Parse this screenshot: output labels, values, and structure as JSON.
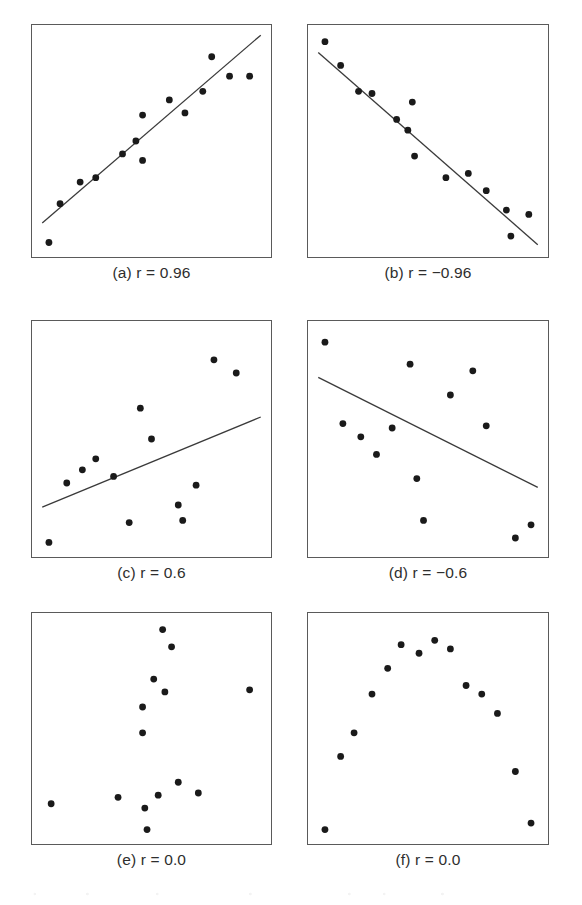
{
  "figure": {
    "background_color": "#ffffff",
    "frame_color": "#5a5a5a",
    "point_color": "#1a1a1a",
    "line_color": "#3a3a3a",
    "caption_color": "#2e2e2e",
    "point_radius": 3.4,
    "layout": {
      "rows": 3,
      "columns": 2
    }
  },
  "panels": [
    {
      "id": "a",
      "caption": "(a) r = 0.96",
      "box": {
        "x": 31,
        "y": 24,
        "width": 241,
        "height": 234
      },
      "caption_y": 264
    },
    {
      "id": "b",
      "caption": "(b) r = −0.96",
      "box": {
        "x": 307,
        "y": 24,
        "width": 242,
        "height": 234
      },
      "caption_y": 264
    },
    {
      "id": "c",
      "caption": "(c) r = 0.6",
      "box": {
        "x": 31,
        "y": 320,
        "width": 241,
        "height": 238
      },
      "caption_y": 564
    },
    {
      "id": "d",
      "caption": "(d) r = −0.6",
      "box": {
        "x": 307,
        "y": 320,
        "width": 242,
        "height": 238
      },
      "caption_y": 564
    },
    {
      "id": "e",
      "caption": "(e) r = 0.0",
      "box": {
        "x": 31,
        "y": 612,
        "width": 241,
        "height": 233
      },
      "caption_y": 851
    },
    {
      "id": "f",
      "caption": "(f) r = 0.0",
      "box": {
        "x": 307,
        "y": 612,
        "width": 242,
        "height": 233
      },
      "caption_y": 851
    }
  ],
  "chart_data": [
    {
      "type": "scatter",
      "id": "a",
      "title": "(a) r = 0.96",
      "correlation": 0.96,
      "xlabel": "",
      "ylabel": "",
      "xlim": [
        0,
        100
      ],
      "ylim": [
        0,
        100
      ],
      "grid": false,
      "legend": null,
      "fit_line": {
        "x1": 1,
        "y1": 12,
        "x2": 99,
        "y2": 99
      },
      "points": [
        [
          4,
          3
        ],
        [
          9,
          21
        ],
        [
          18,
          31
        ],
        [
          25,
          33
        ],
        [
          37,
          44
        ],
        [
          43,
          50
        ],
        [
          46,
          41
        ],
        [
          46,
          62
        ],
        [
          58,
          69
        ],
        [
          65,
          63
        ],
        [
          73,
          73
        ],
        [
          77,
          89
        ],
        [
          85,
          80
        ],
        [
          94,
          80
        ]
      ]
    },
    {
      "type": "scatter",
      "id": "b",
      "title": "(b) r = −0.96",
      "correlation": -0.96,
      "xlabel": "",
      "ylabel": "",
      "xlim": [
        0,
        100
      ],
      "ylim": [
        0,
        100
      ],
      "grid": false,
      "legend": null,
      "fit_line": {
        "x1": 1,
        "y1": 91,
        "x2": 99,
        "y2": 2
      },
      "points": [
        [
          4,
          96
        ],
        [
          11,
          85
        ],
        [
          19,
          73
        ],
        [
          25,
          72
        ],
        [
          36,
          60
        ],
        [
          41,
          55
        ],
        [
          43,
          68
        ],
        [
          44,
          43
        ],
        [
          58,
          33
        ],
        [
          68,
          35
        ],
        [
          76,
          27
        ],
        [
          85,
          18
        ],
        [
          87,
          6
        ],
        [
          95,
          16
        ]
      ]
    },
    {
      "type": "scatter",
      "id": "c",
      "title": "(c) r = 0.6",
      "correlation": 0.6,
      "xlabel": "",
      "ylabel": "",
      "xlim": [
        0,
        100
      ],
      "ylim": [
        0,
        100
      ],
      "grid": false,
      "legend": null,
      "fit_line": {
        "x1": 1,
        "y1": 19,
        "x2": 99,
        "y2": 60
      },
      "points": [
        [
          4,
          3
        ],
        [
          12,
          30
        ],
        [
          19,
          36
        ],
        [
          25,
          41
        ],
        [
          33,
          33
        ],
        [
          40,
          12
        ],
        [
          45,
          64
        ],
        [
          50,
          50
        ],
        [
          62,
          20
        ],
        [
          64,
          13
        ],
        [
          70,
          29
        ],
        [
          78,
          86
        ],
        [
          88,
          80
        ]
      ]
    },
    {
      "type": "scatter",
      "id": "d",
      "title": "(d) r = −0.6",
      "correlation": -0.6,
      "xlabel": "",
      "ylabel": "",
      "xlim": [
        0,
        100
      ],
      "ylim": [
        0,
        100
      ],
      "grid": false,
      "legend": null,
      "fit_line": {
        "x1": 1,
        "y1": 78,
        "x2": 99,
        "y2": 28
      },
      "points": [
        [
          4,
          94
        ],
        [
          12,
          57
        ],
        [
          20,
          51
        ],
        [
          27,
          43
        ],
        [
          34,
          55
        ],
        [
          42,
          84
        ],
        [
          45,
          32
        ],
        [
          48,
          13
        ],
        [
          60,
          70
        ],
        [
          70,
          81
        ],
        [
          76,
          56
        ],
        [
          89,
          5
        ],
        [
          96,
          11
        ]
      ]
    },
    {
      "type": "scatter",
      "id": "e",
      "title": "(e) r = 0.0",
      "correlation": 0.0,
      "xlabel": "",
      "ylabel": "",
      "xlim": [
        0,
        100
      ],
      "ylim": [
        0,
        100
      ],
      "grid": false,
      "legend": null,
      "fit_line": null,
      "points": [
        [
          5,
          15
        ],
        [
          35,
          18
        ],
        [
          46,
          48
        ],
        [
          46,
          60
        ],
        [
          47,
          13
        ],
        [
          48,
          3
        ],
        [
          51,
          73
        ],
        [
          53,
          19
        ],
        [
          55,
          96
        ],
        [
          56,
          67
        ],
        [
          59,
          88
        ],
        [
          62,
          25
        ],
        [
          71,
          20
        ],
        [
          94,
          68
        ]
      ]
    },
    {
      "type": "scatter",
      "id": "f",
      "title": "(f) r = 0.0",
      "correlation": 0.0,
      "xlabel": "",
      "ylabel": "",
      "xlim": [
        0,
        100
      ],
      "ylim": [
        0,
        100
      ],
      "grid": false,
      "legend": null,
      "fit_line": null,
      "points": [
        [
          4,
          3
        ],
        [
          11,
          37
        ],
        [
          17,
          48
        ],
        [
          25,
          66
        ],
        [
          32,
          78
        ],
        [
          38,
          89
        ],
        [
          46,
          85
        ],
        [
          53,
          91
        ],
        [
          60,
          87
        ],
        [
          67,
          70
        ],
        [
          74,
          66
        ],
        [
          81,
          57
        ],
        [
          89,
          30
        ],
        [
          96,
          6
        ]
      ]
    }
  ]
}
